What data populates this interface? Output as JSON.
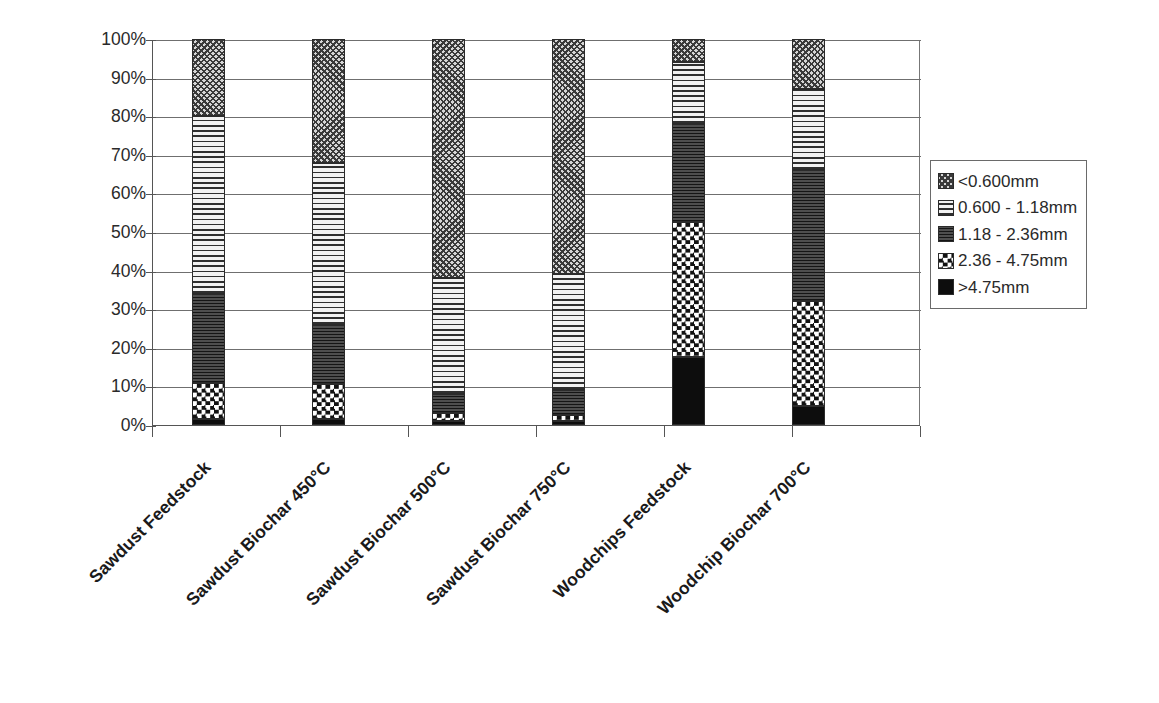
{
  "chart_data": {
    "type": "bar",
    "subtype": "stacked-100-percent",
    "title": "",
    "xlabel": "",
    "ylabel": "",
    "ylim": [
      0,
      100
    ],
    "ytick_labels": [
      "100%",
      "90%",
      "80%",
      "70%",
      "60%",
      "50%",
      "40%",
      "30%",
      "20%",
      "10%",
      "0%"
    ],
    "ytick_values": [
      100,
      90,
      80,
      70,
      60,
      50,
      40,
      30,
      20,
      10,
      0
    ],
    "grid": true,
    "legend_position": "right",
    "categories": [
      "Sawdust Feedstock",
      "Sawdust Biochar 450°C",
      "Sawdust Biochar 500°C",
      "Sawdust Biochar 750°C",
      "Woodchips Feedstock",
      "Woodchip Biochar 700°C"
    ],
    "series": [
      {
        "name": ">4.75mm",
        "pattern": "pat-black",
        "values": [
          1.5,
          1.5,
          1.0,
          1.0,
          17.5,
          5.0
        ]
      },
      {
        "name": "2.36 - 4.75mm",
        "pattern": "pat-check",
        "values": [
          9.5,
          9.0,
          2.0,
          1.5,
          35.0,
          27.0
        ]
      },
      {
        "name": "1.18 - 2.36mm",
        "pattern": "pat-dark",
        "values": [
          23.0,
          15.5,
          5.0,
          6.5,
          25.5,
          34.0
        ]
      },
      {
        "name": "0.600 - 1.18mm",
        "pattern": "pat-hline",
        "values": [
          46.0,
          42.0,
          30.0,
          30.0,
          16.0,
          21.0
        ]
      },
      {
        "name": "<0.600mm",
        "pattern": "pat-wave",
        "values": [
          20.0,
          32.0,
          62.0,
          61.0,
          6.0,
          13.0
        ]
      }
    ],
    "cumulative_tops": [
      [
        1.5,
        11.0,
        34.0,
        80.0,
        100.0
      ],
      [
        1.5,
        10.5,
        26.0,
        68.0,
        100.0
      ],
      [
        1.0,
        3.0,
        8.0,
        38.0,
        100.0
      ],
      [
        1.0,
        2.5,
        9.0,
        39.0,
        100.0
      ],
      [
        17.5,
        52.5,
        78.0,
        94.0,
        100.0
      ],
      [
        5.0,
        32.0,
        66.0,
        87.0,
        100.0
      ]
    ],
    "legend_entries": [
      {
        "label": "<0.600mm",
        "pattern": "pat-wave"
      },
      {
        "label": "0.600 - 1.18mm",
        "pattern": "pat-hline"
      },
      {
        "label": "1.18 - 2.36mm",
        "pattern": "pat-dark"
      },
      {
        "label": "2.36 - 4.75mm",
        "pattern": "pat-check"
      },
      {
        "label": ">4.75mm",
        "pattern": "pat-black"
      }
    ],
    "colors": {
      "axis": "#555555",
      "gridline": "#6f6f6f",
      "segment_border": "#2b2b2b",
      "text": "#1a1a1a",
      "background": "#ffffff"
    }
  },
  "layout": {
    "plot_left": 152,
    "plot_top": 40,
    "plot_width": 768,
    "plot_height": 386,
    "bar_width": 33,
    "bar_centers": [
      207.5,
      327.5,
      447.5,
      567.5,
      687.5,
      807.5
    ]
  }
}
